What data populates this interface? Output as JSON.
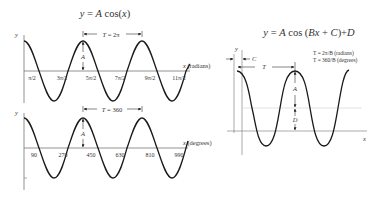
{
  "left": {
    "title": "y = A cos(x)",
    "title_parts": {
      "y": "y",
      "eq": " = ",
      "A": "A",
      "cos": " cos(",
      "x": "x",
      "close": ")"
    },
    "radians_plot": {
      "y_label": "y",
      "x_label": "x (radians)",
      "period_label": "T = 2π",
      "amplitude_label": "A",
      "ticks": [
        "π/2",
        "3π/2",
        "5π/2",
        "7π/2",
        "9π/2",
        "11π/2"
      ]
    },
    "degrees_plot": {
      "y_label": "y",
      "x_label": "x (degrees)",
      "period_label": "T = 360",
      "amplitude_label": "A",
      "ticks": [
        "90",
        "270",
        "450",
        "630",
        "810",
        "990"
      ]
    }
  },
  "right": {
    "title": "y = A cos (Bx + C)+D",
    "y_label": "y",
    "x_label": "x",
    "phase_label": "C",
    "period_label": "T",
    "amplitude_label": "A",
    "offset_label": "D",
    "formula_radians": "T = 2π/B (radians)",
    "formula_degrees": "T = 360/B (degrees)"
  },
  "colors": {
    "curve": "#1a1a1a",
    "axis": "#555555",
    "midline": "#cccccc",
    "text": "#333333"
  }
}
